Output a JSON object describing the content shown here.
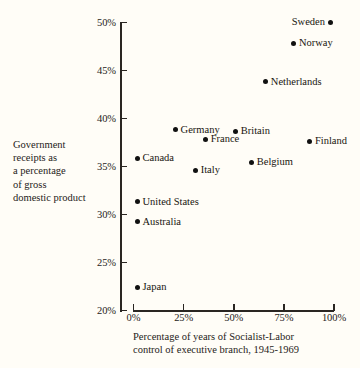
{
  "chart_data": {
    "type": "scatter",
    "title": "",
    "xlabel": "Percentage of years of Socialist-Labor control of executive branch, 1945-1969",
    "ylabel": "Government receipts as a percentage of gross domestic product",
    "xlim": [
      0,
      100
    ],
    "ylim": [
      20,
      50
    ],
    "grid": false,
    "legend": "none",
    "xticks": [
      "0%",
      "25%",
      "50%",
      "75%",
      "100%"
    ],
    "xtick_values": [
      0,
      25,
      50,
      75,
      100
    ],
    "yticks": [
      "20%",
      "25%",
      "30%",
      "35%",
      "40%",
      "45%",
      "50%"
    ],
    "ytick_values": [
      20,
      25,
      30,
      35,
      40,
      45,
      50
    ],
    "points": [
      {
        "label": "Sweden",
        "x": 98,
        "y": 50.0,
        "label_side": "left"
      },
      {
        "label": "Norway",
        "x": 80,
        "y": 47.8,
        "label_side": "right"
      },
      {
        "label": "Netherlands",
        "x": 66,
        "y": 43.8,
        "label_side": "right"
      },
      {
        "label": "Germany",
        "x": 21,
        "y": 38.8,
        "label_side": "right"
      },
      {
        "label": "Britain",
        "x": 51,
        "y": 38.6,
        "label_side": "right"
      },
      {
        "label": "France",
        "x": 36,
        "y": 37.8,
        "label_side": "right"
      },
      {
        "label": "Finland",
        "x": 88,
        "y": 37.6,
        "label_side": "right"
      },
      {
        "label": "Canada",
        "x": 2,
        "y": 35.8,
        "label_side": "right"
      },
      {
        "label": "Belgium",
        "x": 59,
        "y": 35.4,
        "label_side": "right"
      },
      {
        "label": "Italy",
        "x": 31,
        "y": 34.6,
        "label_side": "right"
      },
      {
        "label": "United  States",
        "x": 2,
        "y": 31.3,
        "label_side": "right"
      },
      {
        "label": "Australia",
        "x": 2,
        "y": 29.2,
        "label_side": "right"
      },
      {
        "label": "Japan",
        "x": 2,
        "y": 22.4,
        "label_side": "right"
      }
    ]
  },
  "axes": {
    "y_title_lines": [
      "Government",
      "receipts as",
      "a percentage",
      "of gross",
      "domestic product"
    ],
    "x_title_lines": [
      "Percentage of years of Socialist-Labor",
      "control of executive branch, 1945-1969"
    ]
  },
  "style": {
    "background": "#fffdf7",
    "ink": "#19150f",
    "axis_color": "#2a2622",
    "dot_color": "#111111"
  }
}
